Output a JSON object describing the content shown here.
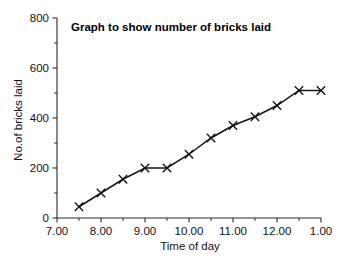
{
  "chart_data": {
    "type": "line",
    "title": "Graph to show number of bricks laid",
    "xlabel": "Time of day",
    "ylabel": "No.of bricks laid",
    "grid": false,
    "legend": "none",
    "marker": "x-cross",
    "xlim": [
      7.0,
      13.0
    ],
    "ylim": [
      0,
      800
    ],
    "y_ticks": [
      0,
      200,
      400,
      600,
      800
    ],
    "y_tick_labels": [
      "0",
      "200",
      "400",
      "600",
      "800"
    ],
    "y_minor_tick_step": 100,
    "x_ticks": [
      7.0,
      8.0,
      9.0,
      10.0,
      11.0,
      12.0,
      13.0
    ],
    "x_tick_labels": [
      "7.00",
      "8.00",
      "9.00",
      "10.00",
      "11.00",
      "12.00",
      "1.00"
    ],
    "x_minor_tick_step": 0.5,
    "x": [
      7.5,
      8.0,
      8.5,
      9.0,
      9.5,
      10.0,
      10.5,
      11.0,
      11.5,
      12.0,
      12.5,
      13.0
    ],
    "x_labels": [
      "7.30",
      "8.00",
      "8.30",
      "9.00",
      "9.30",
      "10.00",
      "10.30",
      "11.00",
      "11.30",
      "12.00",
      "12.30",
      "1.00"
    ],
    "values": [
      45,
      100,
      155,
      200,
      200,
      255,
      320,
      370,
      405,
      450,
      510,
      510
    ],
    "series": [
      {
        "name": "Bricks laid",
        "values": [
          45,
          100,
          155,
          200,
          200,
          255,
          320,
          370,
          405,
          450,
          510,
          510
        ]
      }
    ]
  },
  "colors": {
    "background": "#ffffff",
    "axis": "#2a2a2a",
    "line": "#151515",
    "text": "#111111",
    "title": "#000000"
  }
}
